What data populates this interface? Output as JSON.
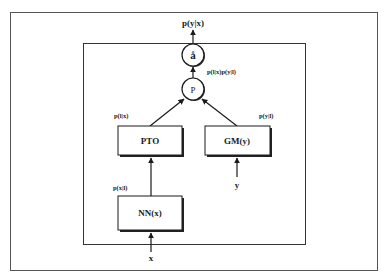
{
  "diagram": {
    "nodes": {
      "sum": {
        "label": "å",
        "type": "circle"
      },
      "product": {
        "label": "P",
        "type": "circle"
      },
      "pto": {
        "label": "PTO",
        "type": "box"
      },
      "gm": {
        "label": "GM(y)",
        "type": "box"
      },
      "nn": {
        "label": "NN(x)",
        "type": "box"
      }
    },
    "edge_labels": {
      "output": "p(y|x)",
      "product_out": "p(l|x)p(y|l)",
      "pto_out": "p(l|x)",
      "gm_out": "p(y|l)",
      "nn_out": "p(x|l)"
    },
    "inputs": {
      "x": "x",
      "y": "y"
    },
    "colors": {
      "line": "#1a1a1a",
      "frame": "#555555",
      "background": "#ffffff"
    }
  }
}
